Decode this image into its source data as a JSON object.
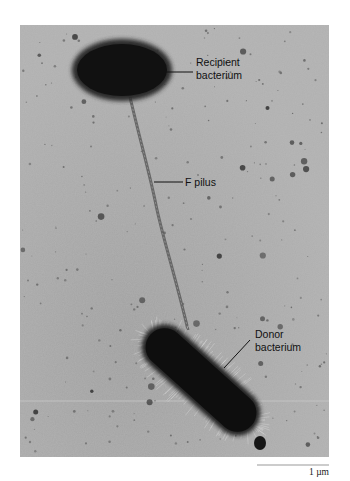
{
  "figure": {
    "labels": {
      "recipient": [
        "Recipient",
        "bacterium"
      ],
      "pilus": "F pilus",
      "donor": [
        "Donor",
        "bacterium"
      ]
    },
    "scale_bar": {
      "label": "1 µm",
      "length_um": 1
    },
    "colors": {
      "background": "#a9a9a9",
      "cell": "#0e0e0e",
      "label_line": "#111111",
      "scale_bar": "#9a9a9a"
    }
  }
}
